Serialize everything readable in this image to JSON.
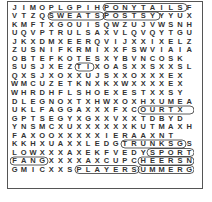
{
  "puzzle": {
    "type": "word-search",
    "rows": [
      "JIMOPLGPIHPONYTAILSF",
      "VTZQSWEATSPOSTSYYYUX",
      "KMFTXGOUISQWZUJVWSNH",
      "UQVPTRULSAXVLQVQYTGU",
      "JKXDMXEERQVIJXXIXEL Z",
      "ZUSNIFKRMIXXFSWVIAIAL",
      "OBTEFKOTESXYBVNCOSK",
      "SUSJXEZTIXOASXXSXXSL",
      "QXSJXOXXUJSXXOXXXEX",
      "WMCUZETKNXKXWXXXXE X",
      "WHRDHFLSHOEXESTXXSY",
      "DLEGNOXTXHWXOXHXUMEA",
      "UKLFAGGAXXXFXCOURTX",
      "GPTSEGYXGXXVXXTDBYD",
      "YNSMCXUXXXXXXKUTMAXH",
      "FAXOOXXXXXIERAAXNT",
      "KKHXUAXXLEDGTRUNKSGS",
      "LOWXXXAXEKFVEDYSPORT",
      "FANGXXXXAXCUPCHEERSN",
      "GMICXXSPLAYERSUMMERG",
      "YQDCTOQAZAGZWXTQJVHP"
    ],
    "found_words": [
      "PONYTAILS",
      "SWEAT",
      "POSTS",
      "COURT",
      "TRUNKS",
      "SPORT",
      "CHEERS",
      "PLAYER",
      "SUMMER",
      "FANG",
      "SHOES",
      "TI"
    ]
  }
}
